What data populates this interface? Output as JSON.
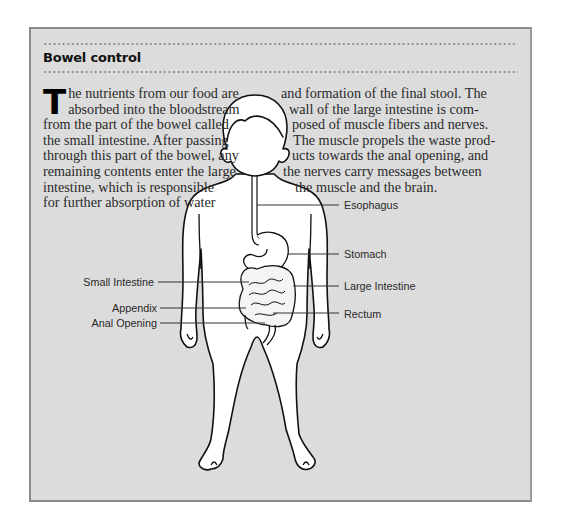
{
  "panel": {
    "title": "Bowel control",
    "background_color": "#dcdcdc",
    "border_color": "#8a8a8a"
  },
  "text": {
    "dropcap": "T",
    "left_column": [
      "he nutrients from our food are",
      "absorbed into the bloodstream",
      "from the part of the bowel called",
      "the small intestine. After passing",
      "through this part of the bowel, any",
      "remaining contents enter the large",
      "intestine, which is responsible",
      "for further absorption of water"
    ],
    "right_column": [
      "and formation of the final stool. The",
      "wall of the large intestine is com-",
      "posed of muscle fibers and nerves.",
      "The muscle propels the waste prod-",
      "ucts towards the anal opening, and",
      "the nerves carry messages between",
      "the muscle and the brain."
    ]
  },
  "diagram": {
    "labels": {
      "esophagus": "Esophagus",
      "stomach": "Stomach",
      "small_intestine": "Small Intestine",
      "large_intestine": "Large Intestine",
      "appendix": "Appendix",
      "rectum": "Rectum",
      "anal_opening": "Anal Opening"
    }
  }
}
